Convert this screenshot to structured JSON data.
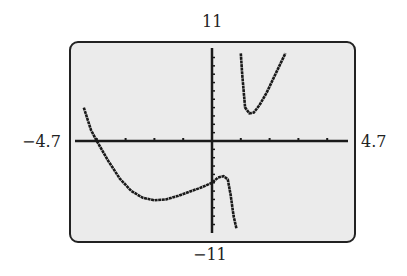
{
  "window": {
    "ymax_label": "11",
    "ymin_label": "−11",
    "xmin_label": "−4.7",
    "xmax_label": "4.7"
  },
  "colors": {
    "screen_bg": "#ebebeb",
    "ink": "#1a1a1a"
  },
  "chart_data": {
    "type": "line",
    "title": "",
    "xlabel": "",
    "ylabel": "",
    "xlim": [
      -4.7,
      4.7
    ],
    "ylim": [
      -11,
      11
    ],
    "xscl": 1,
    "yscl": 1,
    "grid": false,
    "series": [
      {
        "name": "left branch",
        "x": [
          -4.45,
          -4.2,
          -4.0,
          -3.6,
          -3.2,
          -2.8,
          -2.4,
          -2.0,
          -1.6,
          -1.2,
          -0.8,
          -0.4,
          0.0,
          0.2,
          0.4,
          0.55,
          0.65,
          0.75,
          0.85
        ],
        "y": [
          4.0,
          1.3,
          0.0,
          -2.4,
          -4.5,
          -6.0,
          -6.8,
          -7.1,
          -7.0,
          -6.6,
          -6.1,
          -5.6,
          -5.0,
          -4.4,
          -4.2,
          -4.6,
          -6.5,
          -9.0,
          -10.5
        ]
      },
      {
        "name": "right branch",
        "x": [
          1.0,
          1.05,
          1.15,
          1.3,
          1.45,
          1.65,
          1.9,
          2.2,
          2.55
        ],
        "y": [
          10.5,
          8.0,
          4.0,
          3.3,
          3.4,
          4.3,
          5.8,
          8.0,
          10.5
        ]
      }
    ]
  }
}
